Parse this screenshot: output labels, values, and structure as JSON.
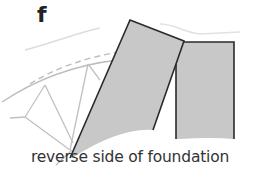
{
  "figure": {
    "step_label": "f",
    "caption": "reverse side of foundation",
    "colors": {
      "panel_fill": "#c8c8c8",
      "panel_stroke": "#2a2a2a",
      "guide_line": "#bdbdbd",
      "text": "#333333"
    }
  }
}
